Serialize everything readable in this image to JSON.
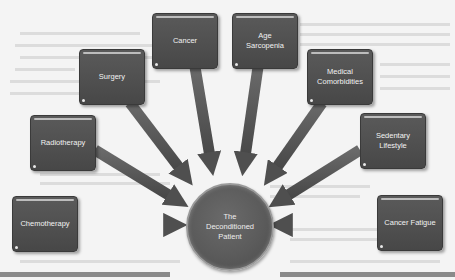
{
  "diagram": {
    "center": {
      "label_lines": [
        "The",
        "Deconditioned",
        "Patient"
      ]
    },
    "factors": [
      {
        "id": "chemotherapy",
        "label_lines": [
          "Chemotherapy"
        ]
      },
      {
        "id": "radiotherapy",
        "label_lines": [
          "Radiotherapy"
        ]
      },
      {
        "id": "surgery",
        "label_lines": [
          "Surgery"
        ]
      },
      {
        "id": "cancer",
        "label_lines": [
          "Cancer"
        ]
      },
      {
        "id": "age-sarcopenia",
        "label_lines": [
          "Age",
          "Sarcopenia"
        ]
      },
      {
        "id": "medical-comorbidities",
        "label_lines": [
          "Medical",
          "Comorbidities"
        ]
      },
      {
        "id": "sedentary-lifestyle",
        "label_lines": [
          "Sedentary",
          "Lifestyle"
        ]
      },
      {
        "id": "cancer-fatigue",
        "label_lines": [
          "Cancer Fatigue"
        ]
      }
    ],
    "colors": {
      "background": "#f4f4f4",
      "box_fill": "#4f4f4f",
      "arrow_fill": "#555555",
      "text": "#f2f2f2"
    }
  }
}
